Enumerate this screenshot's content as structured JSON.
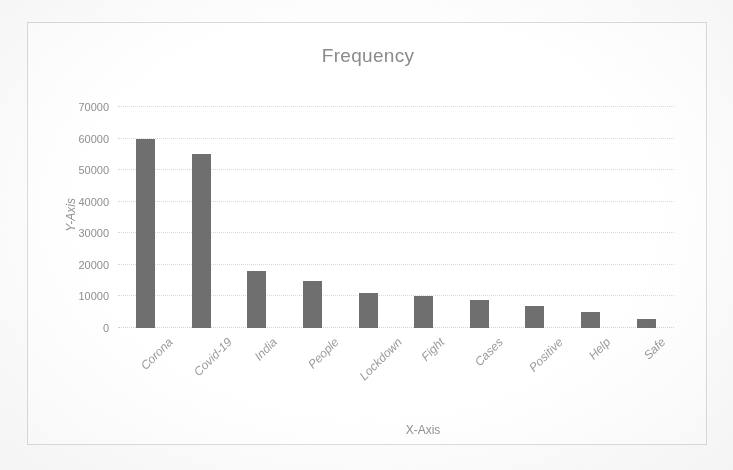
{
  "chart_data": {
    "type": "bar",
    "title": "Frequency",
    "xlabel": "X-Axis",
    "ylabel": "Y-Axis",
    "categories": [
      "Corona",
      "Covid-19",
      "India",
      "People",
      "Lockdown",
      "Fight",
      "Cases",
      "Positive",
      "Help",
      "Safe"
    ],
    "values": [
      60000,
      55000,
      18000,
      15000,
      11000,
      10000,
      9000,
      7000,
      5000,
      3000
    ],
    "series": [
      {
        "name": "Frequency",
        "values": [
          60000,
          55000,
          18000,
          15000,
          11000,
          10000,
          9000,
          7000,
          5000,
          3000
        ]
      }
    ],
    "ylim": [
      0,
      70000
    ],
    "yticks": [
      0,
      10000,
      20000,
      30000,
      40000,
      50000,
      60000,
      70000
    ],
    "ytick_labels": [
      "0",
      "10000",
      "20000",
      "30000",
      "40000",
      "50000",
      "60000",
      "70000"
    ],
    "grid": true,
    "grid_axis": "y",
    "legend": false,
    "legend_position": "none",
    "bar_color": "#6f6f6f",
    "gridline_color": "#d9d9d9",
    "text_color": "#8f8f8f",
    "plot_background": "#ffffff",
    "x_tick_rotation": -45
  }
}
